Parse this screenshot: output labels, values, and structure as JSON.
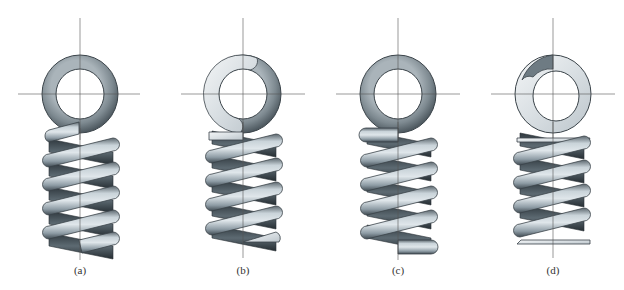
{
  "figure": {
    "panels": [
      {
        "label": "(a)",
        "end_type": "plain",
        "center_x": 80,
        "ring_style": "full-dark",
        "top_end": "plain-cut",
        "bottom_end": "plain-cut"
      },
      {
        "label": "(b)",
        "end_type": "plain-ground",
        "center_x": 243,
        "ring_style": "ground-partial",
        "top_end": "ground-flat",
        "bottom_end": "ground-flat"
      },
      {
        "label": "(c)",
        "end_type": "squared",
        "center_x": 398,
        "ring_style": "full-dark",
        "top_end": "squared",
        "bottom_end": "squared"
      },
      {
        "label": "(d)",
        "end_type": "squared-ground",
        "center_x": 553,
        "ring_style": "ground-full",
        "top_end": "squared-ground",
        "bottom_end": "squared-ground"
      }
    ],
    "colors": {
      "coil_light": "#c9d3d9",
      "coil_mid": "#8e9ca5",
      "coil_dark": "#3f4a51",
      "ring_dark": "#7d8990",
      "ground_face": "#e3e7ea",
      "centerline": "#555555",
      "caption": "#333333",
      "background": "#ffffff"
    }
  }
}
